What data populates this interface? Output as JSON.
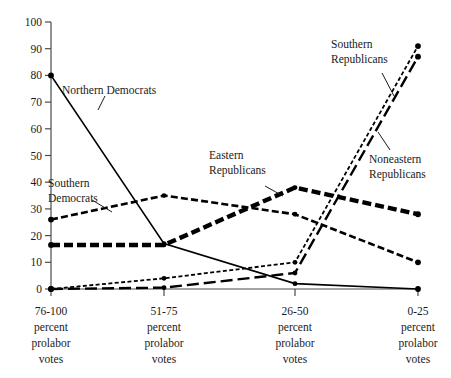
{
  "chart_data": {
    "type": "line",
    "title": "",
    "subtitle": "",
    "xlabel": "",
    "ylabel": "",
    "ylim": [
      0,
      100
    ],
    "ytick_step": 10,
    "grid": false,
    "legend_position": "inline-annotations",
    "categories": [
      "76-100\npercent\nprolabor\nvotes",
      "51-75\npercent\nprolabor\nvotes",
      "26-50\npercent\nprolabor\nvotes",
      "0-25\npercent\nprolabor\nvotes"
    ],
    "category_lines": [
      [
        "76-100",
        "percent",
        "prolabor",
        "votes"
      ],
      [
        "51-75",
        "percent",
        "prolabor",
        "votes"
      ],
      [
        "26-50",
        "percent",
        "prolabor",
        "votes"
      ],
      [
        "0-25",
        "percent",
        "prolabor",
        "votes"
      ]
    ],
    "yticks": [
      0,
      10,
      20,
      30,
      40,
      50,
      60,
      70,
      80,
      90,
      100
    ],
    "series": [
      {
        "name": "Northern Democrats",
        "values": [
          80,
          17,
          2,
          0
        ],
        "style": "solid",
        "color": "#000000"
      },
      {
        "name": "Southern Democrats",
        "values": [
          26,
          35,
          28,
          10
        ],
        "style": "dashed-medium",
        "color": "#000000"
      },
      {
        "name": "Eastern Republicans",
        "values": [
          16.5,
          16.5,
          38,
          28
        ],
        "style": "dashed-thick",
        "color": "#000000"
      },
      {
        "name": "Southern Republicans",
        "values": [
          0,
          4,
          10,
          91
        ],
        "style": "dotted-fine",
        "color": "#000000"
      },
      {
        "name": "Noneastern Republicans",
        "values": [
          0,
          0.5,
          6,
          87
        ],
        "style": "dashed-long",
        "color": "#000000"
      }
    ],
    "annotations": [
      {
        "text": "Northern Democrats",
        "series": "Northern Democrats"
      },
      {
        "text": "Southern",
        "series": "Southern Democrats"
      },
      {
        "text": "Democrats",
        "series": "Southern Democrats"
      },
      {
        "text": "Eastern",
        "series": "Eastern Republicans"
      },
      {
        "text": "Republicans",
        "series": "Eastern Republicans"
      },
      {
        "text": "Southern",
        "series": "Southern Republicans"
      },
      {
        "text": "Republicans",
        "series": "Southern Republicans"
      },
      {
        "text": "Noneastern",
        "series": "Noneastern Republicans"
      },
      {
        "text": "Republicans",
        "series": "Noneastern Republicans"
      }
    ]
  },
  "axis": {
    "y_labels": {
      "t100": "100",
      "t90": "90",
      "t80": "80",
      "t70": "70",
      "t60": "60",
      "t50": "50",
      "t40": "40",
      "t30": "30",
      "t20": "20",
      "t10": "10",
      "t0": "0"
    }
  },
  "labels": {
    "northern_democrats": "Northern Democrats",
    "southern_line1": "Southern",
    "southern_line2": "Democrats",
    "eastern_line1": "Eastern",
    "eastern_line2": "Republicans",
    "south_rep_line1": "Southern",
    "south_rep_line2": "Republicans",
    "noneast_rep_line1": "Noneastern",
    "noneast_rep_line2": "Republicans"
  },
  "xaxis": {
    "c0": {
      "l1": "76-100",
      "l2": "percent",
      "l3": "prolabor",
      "l4": "votes"
    },
    "c1": {
      "l1": "51-75",
      "l2": "percent",
      "l3": "prolabor",
      "l4": "votes"
    },
    "c2": {
      "l1": "26-50",
      "l2": "percent",
      "l3": "prolabor",
      "l4": "votes"
    },
    "c3": {
      "l1": "0-25",
      "l2": "percent",
      "l3": "prolabor",
      "l4": "votes"
    }
  }
}
